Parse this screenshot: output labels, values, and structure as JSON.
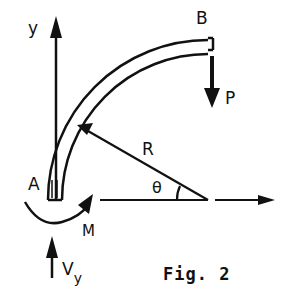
{
  "figure": {
    "caption": "Fig. 2",
    "ink_color": "#111111",
    "background_color": "#ffffff"
  },
  "labels": {
    "axis_y": "y",
    "point_a": "A",
    "point_b": "B",
    "load": "P",
    "radius": "R",
    "angle": "θ",
    "moment": "M",
    "reaction_main": "V",
    "reaction_sub": "y"
  },
  "elements": {
    "beam": "quarter-circle curved beam",
    "y_axis": "upward arrow",
    "x_axis": "rightward arrow",
    "load_arrow": "downward arrow at B",
    "moment_arrow": "curved arrow at A",
    "reaction_arrow": "upward arrow below A"
  }
}
